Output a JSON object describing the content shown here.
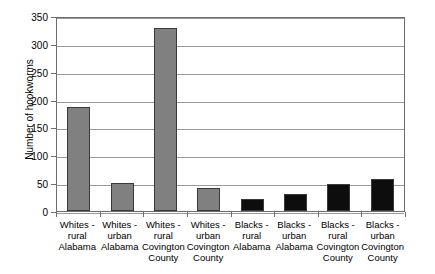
{
  "chart_data": {
    "type": "bar",
    "title": "",
    "xlabel": "",
    "ylabel": "Number of hookworms",
    "ylim": [
      0,
      350
    ],
    "ytick_step": 50,
    "yticks": [
      350,
      300,
      250,
      200,
      150,
      100,
      50,
      0
    ],
    "grid": true,
    "legend": "none",
    "categories": [
      "Whites -\nrural\nAlabama",
      "Whites -\nurban\nAlabama",
      "Whites -\nrural\nCovington\nCounty",
      "Whites -\nurban\nCovington\nCounty",
      "Blacks -\nrural\nAlabama",
      "Blacks -\nurban\nAlabama",
      "Blacks -\nrural\nCovington\nCounty",
      "Blacks -\nurban\nCovington\nCounty"
    ],
    "values": [
      186,
      50,
      328,
      42,
      22,
      30,
      48,
      58
    ],
    "bar_colors": [
      "#808080",
      "#808080",
      "#808080",
      "#808080",
      "#0d0d0d",
      "#0d0d0d",
      "#0d0d0d",
      "#0d0d0d"
    ],
    "colors": {
      "gray_bar": "#808080",
      "black_bar": "#0d0d0d",
      "gridline": "#9a9a9a",
      "axis": "#6d6d6d",
      "background": "#ffffff",
      "text": "#000000"
    }
  }
}
